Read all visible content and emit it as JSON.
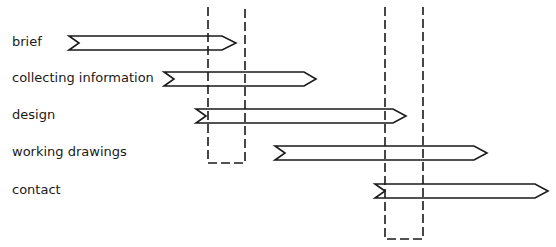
{
  "diagram": {
    "type": "phase-overlap-arrows",
    "stroke_color": "#1a1a1a",
    "background": "#ffffff",
    "phases": [
      {
        "label": "brief",
        "label_y": 34,
        "y_top": 36,
        "y_bottom": 50,
        "tail_x": 69,
        "head_x": 222,
        "tip_x": 236
      },
      {
        "label": "collecting information",
        "label_y": 70,
        "y_top": 72,
        "y_bottom": 86,
        "tail_x": 164,
        "head_x": 304,
        "tip_x": 316
      },
      {
        "label": "design",
        "label_y": 107,
        "y_top": 109,
        "y_bottom": 123,
        "tail_x": 196,
        "head_x": 393,
        "tip_x": 406
      },
      {
        "label": "working drawings",
        "label_y": 144,
        "y_top": 146,
        "y_bottom": 160,
        "tail_x": 275,
        "head_x": 474,
        "tip_x": 487
      },
      {
        "label": "contact",
        "label_y": 182,
        "y_top": 184,
        "y_bottom": 198,
        "tail_x": 375,
        "head_x": 535,
        "tip_x": 548
      }
    ],
    "dashed_boxes": [
      {
        "name": "overlap-zone-1",
        "x1": 208,
        "x2": 245,
        "y1": 7,
        "y2": 163
      },
      {
        "name": "overlap-zone-2",
        "x1": 385,
        "x2": 423,
        "y1": 7,
        "y2": 239
      }
    ]
  }
}
